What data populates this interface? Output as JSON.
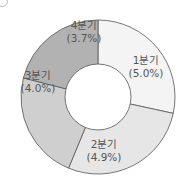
{
  "chart_data": {
    "type": "pie",
    "variant": "donut",
    "title": "",
    "categories": [
      "1분기",
      "2분기",
      "3분기",
      "4분기"
    ],
    "values": [
      5.0,
      4.9,
      4.0,
      3.7
    ],
    "value_labels": [
      "(5.0%)",
      "(4.9%)",
      "(4.0%)",
      "(3.7%)"
    ],
    "colors": [
      "#f4f4f4",
      "#e6e6e6",
      "#cfcfcf",
      "#b2b2b2"
    ],
    "unit": "%",
    "start_angle_deg": 0,
    "direction": "clockwise",
    "legend": "none"
  },
  "segments": [
    {
      "name": "1분기",
      "value": "(5.0%)"
    },
    {
      "name": "2분기",
      "value": "(4.9%)"
    },
    {
      "name": "3분기",
      "value": "(4.0%)"
    },
    {
      "name": "4분기",
      "value": "(3.7%)"
    }
  ]
}
